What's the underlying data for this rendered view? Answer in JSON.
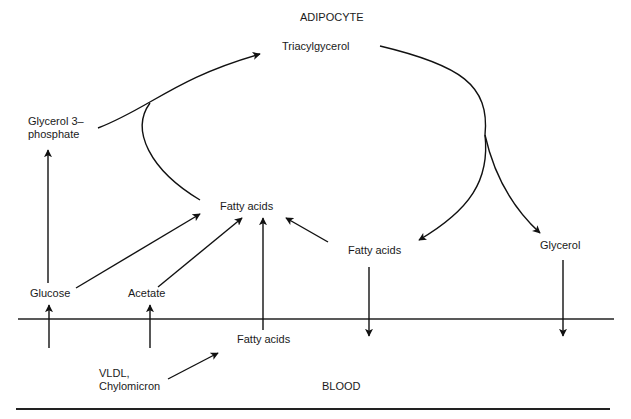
{
  "diagram": {
    "title": "ADIPOCYTE",
    "compartments": {
      "cell": "ADIPOCYTE",
      "blood": "BLOOD"
    },
    "nodes": {
      "triacylglycerol": "Triacylgycerol",
      "glycerol3phosphate": {
        "line1": "Glycerol 3–",
        "line2": "phosphate"
      },
      "fatty_acids_center": "Fatty acids",
      "fatty_acids_right": "Fatty acids",
      "glycerol": "Glycerol",
      "glucose": "Glucose",
      "acetate": "Acetate",
      "fatty_acids_blood": "Fatty acids",
      "vldl": {
        "line1": "VLDL,",
        "line2": "Chylomicron"
      }
    },
    "edges": [
      {
        "from": "Glycerol 3-phosphate",
        "to": "Triacylgycerol"
      },
      {
        "from": "Fatty acids (center)",
        "to": "Triacylgycerol"
      },
      {
        "from": "Triacylgycerol",
        "to": "Fatty acids (right)"
      },
      {
        "from": "Triacylgycerol",
        "to": "Glycerol"
      },
      {
        "from": "Glucose",
        "to": "Glycerol 3-phosphate"
      },
      {
        "from": "Glucose",
        "to": "Fatty acids (center)"
      },
      {
        "from": "Acetate",
        "to": "Fatty acids (center)"
      },
      {
        "from": "Fatty acids (blood)",
        "to": "Fatty acids (center)"
      },
      {
        "from": "Fatty acids (right)",
        "to": "Fatty acids (center)"
      },
      {
        "from": "VLDL, Chylomicron",
        "to": "Fatty acids (blood)"
      },
      {
        "from": "Blood",
        "to": "Glucose"
      },
      {
        "from": "Blood",
        "to": "Acetate"
      },
      {
        "from": "Fatty acids (right)",
        "to": "Blood"
      },
      {
        "from": "Glycerol",
        "to": "Blood"
      }
    ]
  }
}
